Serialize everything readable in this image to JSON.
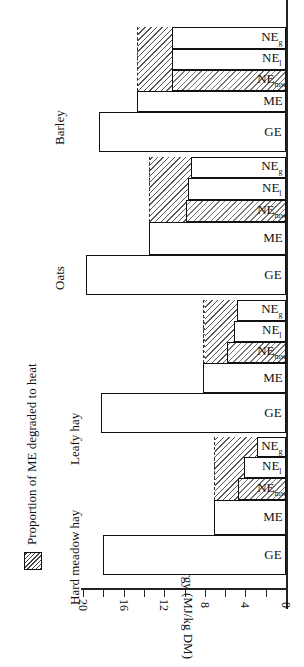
{
  "chart_data": {
    "type": "bar",
    "orientation": "rotated-horizontal",
    "title": "",
    "xlabel": "",
    "ylabel": "Energy (MJ/kg DM)",
    "ylim": [
      0,
      20
    ],
    "yticks": [
      0,
      4,
      8,
      12,
      16,
      20
    ],
    "categories": [
      "Hard meadow hay",
      "Leafy hay",
      "Oats",
      "Barley"
    ],
    "series": [
      {
        "name": "GE",
        "values": [
          18.0,
          18.2,
          19.7,
          18.4
        ]
      },
      {
        "name": "ME",
        "values": [
          7.1,
          8.2,
          13.5,
          14.7
        ]
      },
      {
        "name": "NEmw",
        "values": [
          4.7,
          5.8,
          9.9,
          11.2
        ]
      },
      {
        "name": "NEl",
        "values": [
          4.1,
          5.1,
          9.7,
          11.2
        ]
      },
      {
        "name": "NEg",
        "values": [
          2.9,
          4.8,
          9.4,
          11.2
        ]
      }
    ],
    "legend": [
      "Proportion of ME degraded to heat"
    ],
    "legend_position": "top-left"
  },
  "axis": {
    "title": "Energy (MJ/kg DM)",
    "ticks": [
      "0",
      "4",
      "8",
      "12",
      "16",
      "20"
    ]
  },
  "legend": {
    "label": "Proportion of ME degraded to heat"
  },
  "categories": [
    "Hard meadow hay",
    "Leafy hay",
    "Oats",
    "Barley"
  ],
  "bar_labels": {
    "ge": "GE",
    "me": "ME",
    "ne": "NE",
    "mw": "mw",
    "l": "l",
    "g": "g"
  }
}
